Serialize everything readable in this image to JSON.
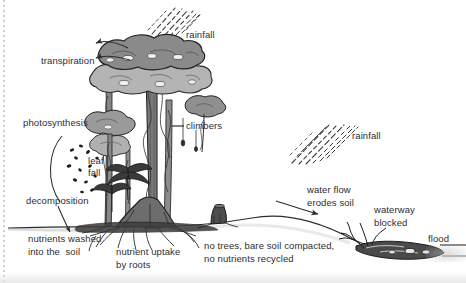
{
  "figure": {
    "background_color": "#ffffff",
    "ink_color": "#2d2d2d",
    "canopy_dark_color": "#8a8a8a",
    "canopy_light_color": "#b4b4b4",
    "trunk_color": "#6f6f6f"
  },
  "labels": {
    "rainfall_left": "rainfall",
    "transpiration": "transpiration",
    "photosynthesis": "photosynthesis",
    "climbers": "climbers",
    "leaf_fall_line1": "leaf",
    "leaf_fall_line2": "fall",
    "decomposition": "decomposition",
    "nutrients_washed_line1": "nutrients washed",
    "nutrients_washed_line2": "into the  soil",
    "nutrient_uptake_line1": "nutrient uptake",
    "nutrient_uptake_line2": "by roots",
    "no_trees_line1": "no trees, bare soil compacted,",
    "no_trees_line2": "no nutrients recycled",
    "rainfall_right": "rainfall",
    "water_flow_line1": "water flow",
    "water_flow_line2": "erodes soil",
    "waterway_line1": "waterway",
    "waterway_line2": "blocked",
    "flood": "flood"
  },
  "icons": {
    "rain_streaks_left": "rain-streaks-icon",
    "rain_streaks_right": "rain-streaks-icon",
    "transpiration_arrows": "curved-arrow-icon",
    "photosynthesis_arc": "arc-arrow-icon",
    "leaf_fall_specks": "falling-leaves-icon",
    "nutrients_arrow": "arrow-icon",
    "climbers_leader": "leader-line-icon",
    "water_flow_arrow": "arrow-icon",
    "canopy": "tree-canopy-icon",
    "trunks": "tree-trunk-icon",
    "buttress_roots": "roots-icon",
    "stump": "tree-stump-icon",
    "debris_dam": "debris-dam-icon",
    "ground_line": "ground-line-icon",
    "flood_water_line": "water-line-icon"
  }
}
